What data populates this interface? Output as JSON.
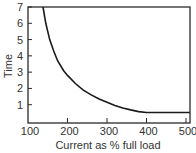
{
  "chart_data": {
    "type": "line",
    "title": "",
    "xlabel": "Current as % full load",
    "ylabel": "Time",
    "xlim": [
      100,
      510
    ],
    "ylim": [
      0,
      7
    ],
    "xticks": [
      100,
      200,
      300,
      400,
      500
    ],
    "yticks": [
      1,
      2,
      3,
      4,
      5,
      6,
      7
    ],
    "grid": false,
    "legend": null,
    "series": [
      {
        "name": "Inverse time-current characteristic",
        "x": [
          138,
          145,
          155,
          165,
          175,
          190,
          200,
          220,
          240,
          260,
          280,
          300,
          320,
          340,
          360,
          380,
          400,
          450,
          500,
          510
        ],
        "y": [
          7.0,
          6.0,
          5.0,
          4.3,
          3.7,
          3.1,
          2.8,
          2.3,
          1.9,
          1.6,
          1.35,
          1.15,
          0.95,
          0.8,
          0.68,
          0.58,
          0.52,
          0.52,
          0.52,
          0.52
        ]
      }
    ]
  }
}
